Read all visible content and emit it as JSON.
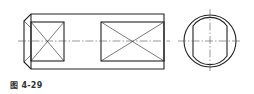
{
  "figure": {
    "type": "engineering-drawing",
    "caption": "图 4-29",
    "stroke_color": "#222222",
    "centerline_color": "#555555",
    "front_view": {
      "outer": {
        "x1": 24,
        "y1": 14,
        "x2": 164,
        "y2": 69
      },
      "chamfer_x": 31,
      "left_cutout": {
        "x1": 31,
        "y1": 22,
        "x2": 64,
        "y2": 61
      },
      "right_cutout": {
        "x1": 101,
        "y1": 22,
        "x2": 164,
        "y2": 61
      },
      "centerline_y": 41
    },
    "side_view": {
      "cx": 210,
      "cy": 41,
      "outer_r": 26,
      "inner_r": 21,
      "flat_left_x": 193,
      "flat_right_x": 227
    }
  }
}
